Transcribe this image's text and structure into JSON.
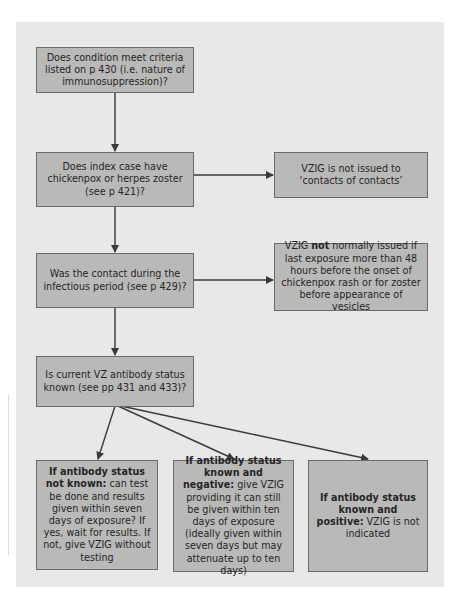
{
  "diagram": {
    "type": "flowchart",
    "colors": {
      "panel_background": "#e8e8e6",
      "box_fill": "#b9b9b7",
      "box_border": "#6a6a6a",
      "arrow": "#3a3a3a",
      "text": "#262626"
    },
    "nodes": {
      "q1": {
        "text": "Does condition meet criteria listed on p 430 (i.e. nature of immunosuppression)?"
      },
      "q2": {
        "text": "Does index case have chickenpox or herpes zoster (see p 421)?"
      },
      "q3": {
        "text": "Was the contact during the infectious period (see p 429)?"
      },
      "q4": {
        "text": "Is current VZ antibody status known (see pp 431 and 433)?"
      },
      "n_contacts": {
        "text": "VZIG is not issued to ‘contacts of contacts’"
      },
      "n_exposure": {
        "prefix": "VZIG ",
        "bold": "not",
        "suffix": " normally issued if last exposure more than 48 hours before the onset of chickenpox rash or for zoster before appearance of vesicles"
      },
      "o_unknown": {
        "bold": "If antibody status not known:",
        "text": " can test be done and results given within seven days of exposure? If yes, wait for results. If not, give VZIG without testing"
      },
      "o_negative": {
        "bold": "If antibody status known and negative:",
        "text": " give VZIG providing it can still be given within ten days of exposure (ideally given within seven days but may attenuate up to ten days)"
      },
      "o_positive": {
        "bold": "If antibody status known and positive:",
        "text": " VZIG is not indicated"
      }
    },
    "edges": [
      {
        "from": "q1",
        "to": "q2"
      },
      {
        "from": "q2",
        "to": "q3"
      },
      {
        "from": "q2",
        "to": "n_contacts"
      },
      {
        "from": "q3",
        "to": "q4"
      },
      {
        "from": "q3",
        "to": "n_exposure"
      },
      {
        "from": "q4",
        "to": "o_unknown"
      },
      {
        "from": "q4",
        "to": "o_negative"
      },
      {
        "from": "q4",
        "to": "o_positive"
      }
    ]
  }
}
